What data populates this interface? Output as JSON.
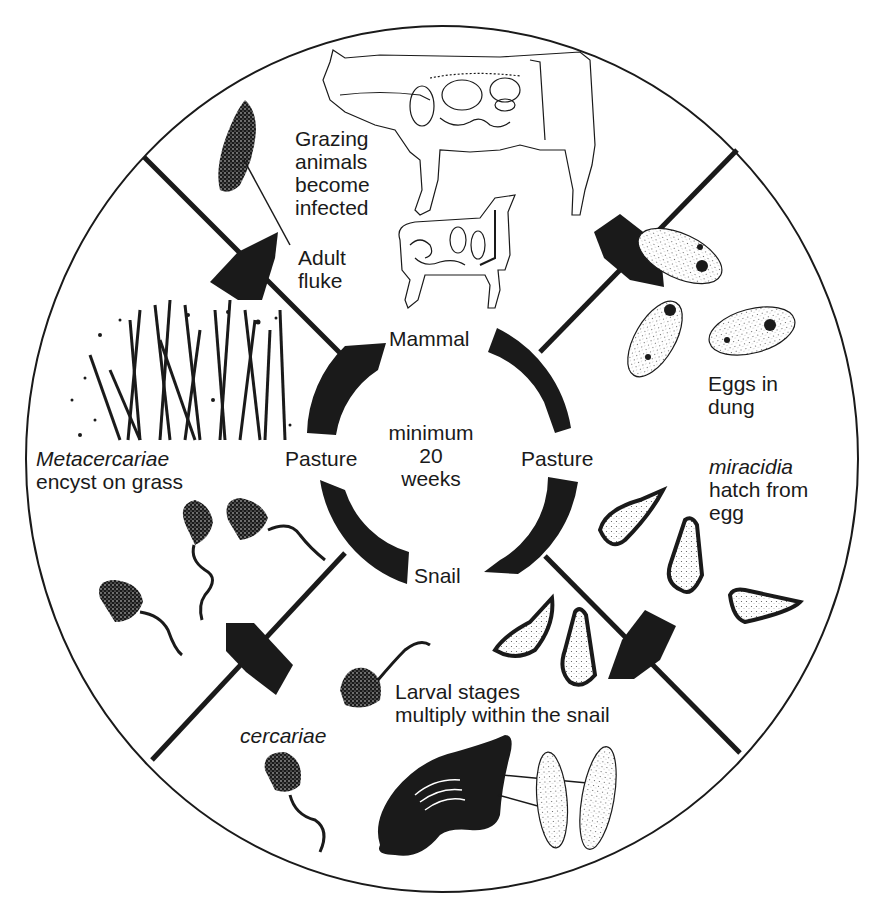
{
  "diagram": {
    "type": "life-cycle",
    "colors": {
      "ink": "#1a1a1a",
      "background": "#ffffff"
    },
    "center": {
      "lines": [
        "minimum",
        "20",
        "weeks"
      ]
    },
    "ring_labels": {
      "top": "Mammal",
      "right": "Pasture",
      "bottom": "Snail",
      "left": "Pasture"
    },
    "stages": [
      {
        "id": "grazing",
        "lines": [
          "Grazing",
          "animals",
          "become",
          "infected"
        ],
        "italic_first": false
      },
      {
        "id": "adult-fluke",
        "lines": [
          "Adult",
          "fluke"
        ],
        "italic_first": false
      },
      {
        "id": "eggs",
        "lines": [
          "Eggs in",
          "dung"
        ],
        "italic_first": false
      },
      {
        "id": "miracidia",
        "lines": [
          "miracidia",
          "hatch from",
          "egg"
        ],
        "italic_first": true
      },
      {
        "id": "larval",
        "lines": [
          "Larval stages",
          "multiply within the snail"
        ],
        "italic_first": false
      },
      {
        "id": "cercariae",
        "lines": [
          "cercariae"
        ],
        "italic_first": true
      },
      {
        "id": "metacercariae",
        "lines": [
          "Metacercariae",
          "encyst on grass"
        ],
        "italic_first": true
      }
    ],
    "illustrations": [
      "cow",
      "sheep",
      "adult-fluke",
      "eggs",
      "miracidia",
      "sporocysts",
      "snail",
      "cercariae",
      "grass"
    ]
  }
}
